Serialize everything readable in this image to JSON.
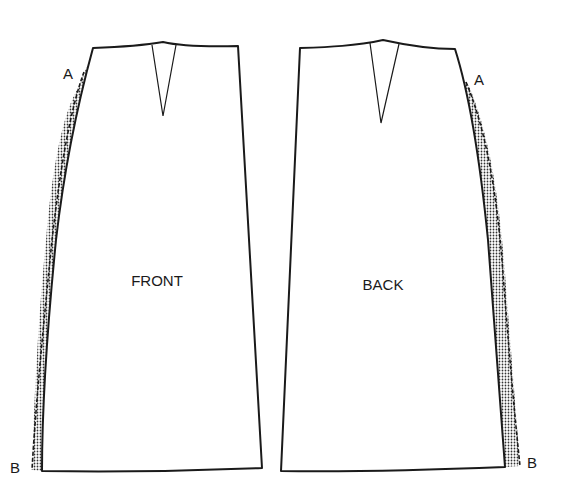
{
  "diagram": {
    "type": "sewing-pattern",
    "pieces": [
      {
        "id": "front",
        "label": "FRONT",
        "points": {
          "top": "A",
          "bottom": "B"
        },
        "shaded_side": "left"
      },
      {
        "id": "back",
        "label": "BACK",
        "points": {
          "top": "A",
          "bottom": "B"
        },
        "shaded_side": "right"
      }
    ],
    "colors": {
      "line": "#1a1a1a",
      "background": "#ffffff"
    }
  }
}
